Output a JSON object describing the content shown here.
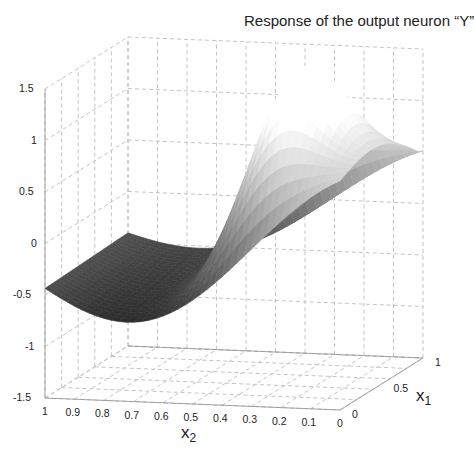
{
  "chart_data": {
    "type": "surface3d",
    "title": "Response of the output neuron “Y”",
    "xlabel": "x2",
    "ylabel": "x1",
    "zlabel": "",
    "x2_ticks": [
      "1",
      "0.9",
      "0.8",
      "0.7",
      "0.6",
      "0.5",
      "0.4",
      "0.3",
      "0.2",
      "0.1",
      "0"
    ],
    "x1_ticks": [
      "0",
      "0.5",
      "1"
    ],
    "z_ticks": [
      "-1.5",
      "-1",
      "-0.5",
      "0",
      "0.5",
      "1",
      "1.5"
    ],
    "x2_range": [
      0,
      1
    ],
    "x1_range": [
      0,
      1
    ],
    "zlim": [
      -1.5,
      1.5
    ],
    "grid": true,
    "colormap": "gray",
    "surface_description": "Saddle-like wave: minimum about -0.85 near x2=0.8, x1=0; maximum about 1.1 near x2=0.25, x1=0.5; edges near -0.5 at x2=1 and about 0.2 at x2=0",
    "sample_points": [
      {
        "x2": 1.0,
        "x1": 0.0,
        "z": -0.5
      },
      {
        "x2": 0.8,
        "x1": 0.0,
        "z": -0.85
      },
      {
        "x2": 0.6,
        "x1": 0.0,
        "z": -0.55
      },
      {
        "x2": 0.4,
        "x1": 0.0,
        "z": 0.1
      },
      {
        "x2": 0.2,
        "x1": 0.0,
        "z": 0.05
      },
      {
        "x2": 0.0,
        "x1": 0.0,
        "z": 0.2
      },
      {
        "x2": 1.0,
        "x1": 1.0,
        "z": -0.1
      },
      {
        "x2": 0.7,
        "x1": 1.0,
        "z": -0.2
      },
      {
        "x2": 0.35,
        "x1": 0.5,
        "z": 0.6
      },
      {
        "x2": 0.25,
        "x1": 0.5,
        "z": 1.1
      },
      {
        "x2": 0.1,
        "x1": 1.0,
        "z": 0.5
      }
    ]
  },
  "labels": {
    "title": "Response of the output neuron “Y”",
    "x2_main": "x",
    "x2_sub": "2",
    "x1_main": "x",
    "x1_sub": "1"
  }
}
